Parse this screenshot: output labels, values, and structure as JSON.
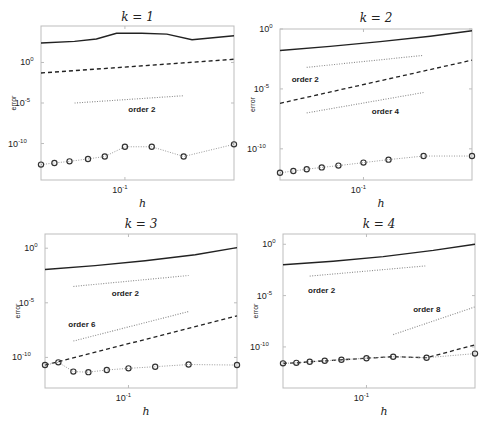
{
  "figure": {
    "ylabel": "error",
    "xlabel": "h",
    "xtick_label": "10",
    "xtick_exp": "-1"
  },
  "chart_data": [
    {
      "type": "line",
      "title": "k = 1",
      "xlabel": "h",
      "ylabel": "error",
      "xscale": "log",
      "yscale": "log",
      "xlim_log10": [
        -1.5,
        -0.35
      ],
      "ylim_log10": [
        -14.5,
        4.5
      ],
      "yticks": [
        {
          "label": "10",
          "exp": "0",
          "v": 0
        },
        {
          "label": "10",
          "exp": "-5",
          "v": -5
        },
        {
          "label": "10",
          "exp": "-10",
          "v": -10
        }
      ],
      "xticks": [
        {
          "label": "10",
          "exp": "-1",
          "v": -1
        }
      ],
      "series": [
        {
          "name": "solid",
          "style": "solid",
          "x": [
            -1.5,
            -1.3,
            -1.17,
            -1.05,
            -0.9,
            -0.75,
            -0.6,
            -0.35
          ],
          "y": [
            2.4,
            2.6,
            2.9,
            3.6,
            3.6,
            3.5,
            2.8,
            3.3
          ]
        },
        {
          "name": "dashed",
          "style": "dashed",
          "x": [
            -1.5,
            -0.35
          ],
          "y": [
            -1.3,
            0.4
          ]
        },
        {
          "name": "circles",
          "style": "dotted-markers",
          "x": [
            -1.5,
            -1.42,
            -1.33,
            -1.22,
            -1.12,
            -1.0,
            -0.84,
            -0.65,
            -0.35
          ],
          "y": [
            -12.6,
            -12.4,
            -12.2,
            -11.9,
            -11.6,
            -10.4,
            -10.4,
            -11.6,
            -10.1
          ]
        },
        {
          "name": "ref order 2",
          "style": "ref",
          "x": [
            -1.3,
            -0.65
          ],
          "y": [
            -5.0,
            -4.1
          ]
        }
      ],
      "annotations": [
        {
          "text": "order 2",
          "x": -0.98,
          "y": -6.1
        }
      ]
    },
    {
      "type": "line",
      "title": "k = 2",
      "xlabel": "h",
      "ylabel": "error",
      "xscale": "log",
      "yscale": "log",
      "xlim_log10": [
        -1.5,
        -0.35
      ],
      "ylim_log10": [
        -12.6,
        0
      ],
      "yticks": [
        {
          "label": "10",
          "exp": "0",
          "v": 0
        },
        {
          "label": "10",
          "exp": "-5",
          "v": -5
        },
        {
          "label": "10",
          "exp": "-10",
          "v": -10
        }
      ],
      "xticks": [
        {
          "label": "10",
          "exp": "-1",
          "v": -1
        }
      ],
      "series": [
        {
          "name": "solid",
          "style": "solid",
          "x": [
            -1.5,
            -1.2,
            -0.9,
            -0.6,
            -0.35
          ],
          "y": [
            -1.8,
            -1.45,
            -1.05,
            -0.6,
            -0.15
          ]
        },
        {
          "name": "dashed",
          "style": "dashed",
          "x": [
            -1.5,
            -0.35
          ],
          "y": [
            -6.2,
            -2.6
          ]
        },
        {
          "name": "circles",
          "style": "dotted-markers",
          "x": [
            -1.5,
            -1.42,
            -1.34,
            -1.25,
            -1.15,
            -1.0,
            -0.85,
            -0.64,
            -0.35
          ],
          "y": [
            -12.0,
            -11.85,
            -11.7,
            -11.55,
            -11.4,
            -11.15,
            -10.9,
            -10.6,
            -10.6
          ]
        },
        {
          "name": "ref order 2",
          "style": "ref",
          "x": [
            -1.34,
            -0.64
          ],
          "y": [
            -3.2,
            -2.2
          ]
        },
        {
          "name": "ref order 4",
          "style": "ref",
          "x": [
            -1.34,
            -0.64
          ],
          "y": [
            -7.0,
            -5.3
          ]
        }
      ],
      "annotations": [
        {
          "text": "order 2",
          "x": -1.43,
          "y": -4.4
        },
        {
          "text": "order 4",
          "x": -0.95,
          "y": -7.1
        }
      ]
    },
    {
      "type": "line",
      "title": "k = 3",
      "xlabel": "h",
      "ylabel": "error",
      "xscale": "log",
      "yscale": "log",
      "xlim_log10": [
        -1.5,
        -0.35
      ],
      "ylim_log10": [
        -12.8,
        1.3
      ],
      "yticks": [
        {
          "label": "10",
          "exp": "0",
          "v": 0
        },
        {
          "label": "10",
          "exp": "-5",
          "v": -5
        },
        {
          "label": "10",
          "exp": "-10",
          "v": -10
        }
      ],
      "xticks": [
        {
          "label": "10",
          "exp": "-1",
          "v": -1
        }
      ],
      "series": [
        {
          "name": "solid",
          "style": "solid",
          "x": [
            -1.5,
            -1.2,
            -0.9,
            -0.6,
            -0.35
          ],
          "y": [
            -1.95,
            -1.6,
            -1.15,
            -0.6,
            0.05
          ]
        },
        {
          "name": "dashed",
          "style": "dashed",
          "x": [
            -1.5,
            -0.35
          ],
          "y": [
            -10.7,
            -6.2
          ]
        },
        {
          "name": "circles",
          "style": "dotted-markers",
          "x": [
            -1.5,
            -1.42,
            -1.33,
            -1.24,
            -1.13,
            -1.0,
            -0.84,
            -0.64,
            -0.35
          ],
          "y": [
            -10.7,
            -10.45,
            -11.3,
            -11.35,
            -11.15,
            -11.0,
            -10.85,
            -10.65,
            -10.7
          ]
        },
        {
          "name": "ref order 2",
          "style": "ref",
          "x": [
            -1.33,
            -0.64
          ],
          "y": [
            -3.5,
            -2.5
          ]
        },
        {
          "name": "ref order 6",
          "style": "ref",
          "x": [
            -1.33,
            -0.64
          ],
          "y": [
            -8.5,
            -5.8
          ]
        }
      ],
      "annotations": [
        {
          "text": "order 2",
          "x": -1.1,
          "y": -4.4
        },
        {
          "text": "order 6",
          "x": -1.36,
          "y": -7.25
        }
      ]
    },
    {
      "type": "line",
      "title": "k = 4",
      "xlabel": "h",
      "ylabel": "error",
      "xscale": "log",
      "yscale": "log",
      "xlim_log10": [
        -1.5,
        -0.35
      ],
      "ylim_log10": [
        -14.0,
        1.0
      ],
      "yticks": [
        {
          "label": "10",
          "exp": "0",
          "v": 0
        },
        {
          "label": "10",
          "exp": "-5",
          "v": -5
        },
        {
          "label": "10",
          "exp": "-10",
          "v": -10
        }
      ],
      "xticks": [
        {
          "label": "10",
          "exp": "-1",
          "v": -1
        }
      ],
      "series": [
        {
          "name": "solid",
          "style": "solid",
          "x": [
            -1.5,
            -1.2,
            -0.9,
            -0.6,
            -0.35
          ],
          "y": [
            -2.0,
            -1.65,
            -1.2,
            -0.6,
            0.0
          ]
        },
        {
          "name": "dashed",
          "style": "dashed",
          "x": [
            -1.5,
            -1.42,
            -1.34,
            -1.25,
            -1.15,
            -1.0,
            -0.84,
            -0.64,
            -0.35
          ],
          "y": [
            -11.6,
            -11.55,
            -11.45,
            -11.35,
            -11.25,
            -11.1,
            -10.95,
            -11.05,
            -9.8
          ]
        },
        {
          "name": "circles",
          "style": "dotted-markers",
          "x": [
            -1.5,
            -1.42,
            -1.34,
            -1.25,
            -1.15,
            -1.0,
            -0.84,
            -0.64,
            -0.35
          ],
          "y": [
            -11.6,
            -11.55,
            -11.45,
            -11.35,
            -11.25,
            -11.1,
            -10.95,
            -11.05,
            -10.65
          ]
        },
        {
          "name": "ref order 2",
          "style": "ref",
          "x": [
            -1.34,
            -0.64
          ],
          "y": [
            -3.1,
            -2.1
          ]
        },
        {
          "name": "ref order 8",
          "style": "ref",
          "x": [
            -0.84,
            -0.35
          ],
          "y": [
            -8.8,
            -6.1
          ]
        }
      ],
      "annotations": [
        {
          "text": "order 2",
          "x": -1.35,
          "y": -4.75
        },
        {
          "text": "order 8",
          "x": -0.72,
          "y": -6.6
        }
      ]
    }
  ],
  "layout": {
    "panels": [
      {
        "left": 41,
        "top": 26,
        "right": 234,
        "bottom": 180,
        "title_y": 21
      },
      {
        "left": 280,
        "top": 29,
        "right": 472,
        "bottom": 180,
        "title_y": 22
      },
      {
        "left": 45,
        "top": 234,
        "right": 237,
        "bottom": 388,
        "title_y": 228
      },
      {
        "left": 283,
        "top": 234,
        "right": 475,
        "bottom": 388,
        "title_y": 228
      }
    ]
  }
}
